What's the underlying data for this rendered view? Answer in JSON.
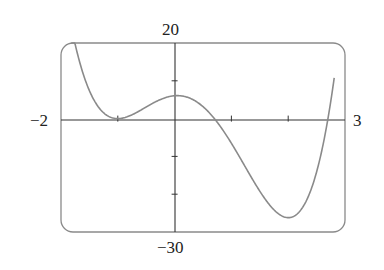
{
  "chart_data": {
    "type": "line",
    "title": "",
    "xlabel": "",
    "ylabel": "",
    "xlim": [
      -2,
      3
    ],
    "ylim": [
      -30,
      20
    ],
    "x_ticks": [
      -1,
      0,
      1,
      2
    ],
    "y_ticks": [
      10,
      -10,
      -20
    ],
    "grid": false,
    "legend": null,
    "corner_labels": {
      "x_min": "−2",
      "x_max": "3",
      "y_max": "20",
      "y_min": "−30"
    },
    "series": [
      {
        "name": "f(x)",
        "description": "quartic with double root at x=-1, local max ~6 at x=0, minimum ~-27 near x=2, crosses zero near x=0.7 and x=2.7",
        "x": [
          -1.8,
          -1.5,
          -1.25,
          -1.0,
          -0.75,
          -0.5,
          -0.25,
          0.0,
          0.25,
          0.5,
          0.75,
          1.0,
          1.25,
          1.5,
          1.75,
          2.0,
          2.2,
          2.4,
          2.6,
          2.8
        ],
        "y": [
          21.5,
          7.1,
          1.7,
          0.0,
          1.6,
          4.0,
          5.6,
          6.0,
          5.3,
          2.9,
          -0.9,
          -6.0,
          -12.0,
          -18.3,
          -23.6,
          -26.2,
          -25.6,
          -20.9,
          -11.1,
          5.3
        ]
      }
    ]
  },
  "colors": {
    "curve": "#8a8a8a",
    "frame": "#8a8a8a",
    "axis": "#333333"
  }
}
